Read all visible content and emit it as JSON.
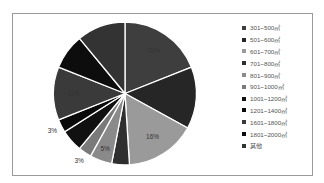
{
  "chart_data": {
    "type": "pie",
    "title": "",
    "categories": [
      "301~500㎡",
      "501~600㎡",
      "601~700㎡",
      "701~800㎡",
      "801~900㎡",
      "901~1000㎡",
      "1001~1200㎡",
      "1201~1400㎡",
      "1601~1800㎡",
      "1801~2000㎡",
      "其他"
    ],
    "values": [
      19,
      14,
      16,
      4,
      5,
      3,
      5,
      3,
      12,
      8,
      11
    ],
    "labels_shown": [
      "19%",
      "",
      "16%",
      "4%",
      "5%",
      "3%",
      "",
      "3%",
      "11%",
      "",
      "11%"
    ],
    "colors": [
      "#3e3e3e",
      "#262626",
      "#9a9a9a",
      "#2f2f2f",
      "#8a8a8a",
      "#7a7a7a",
      "#111111",
      "#0a0a0a",
      "#3a3a3a",
      "#0d0d0d",
      "#333333"
    ],
    "legend_position": "right",
    "start_angle_deg": 0,
    "direction": "clockwise"
  },
  "legend": {
    "items": [
      {
        "label": "301~500㎡",
        "color": "#3e3e3e"
      },
      {
        "label": "501~600㎡",
        "color": "#262626"
      },
      {
        "label": "601~700㎡",
        "color": "#9a9a9a"
      },
      {
        "label": "701~800㎡",
        "color": "#2f2f2f"
      },
      {
        "label": "801~900㎡",
        "color": "#8a8a8a"
      },
      {
        "label": "901~1000㎡",
        "color": "#7a7a7a"
      },
      {
        "label": "1001~1200㎡",
        "color": "#111111"
      },
      {
        "label": "1201~1400㎡",
        "color": "#0a0a0a"
      },
      {
        "label": "1601~1800㎡",
        "color": "#3a3a3a"
      },
      {
        "label": "1801~2000㎡",
        "color": "#0d0d0d"
      },
      {
        "label": "其他",
        "color": "#333333"
      }
    ]
  }
}
